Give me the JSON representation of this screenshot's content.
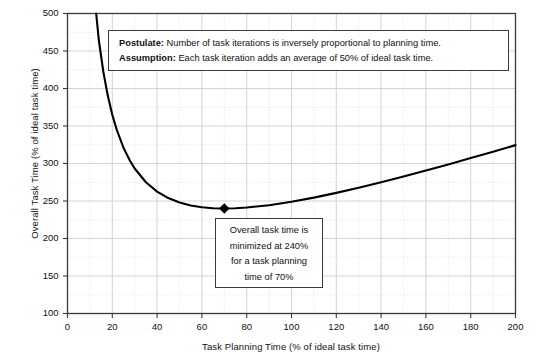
{
  "chart_data": {
    "type": "line",
    "title": "",
    "xlabel": "Task Planning Time (% of ideal task time)",
    "ylabel": "Overall Task Time (% of ideal task time)",
    "xlim": [
      0,
      200
    ],
    "ylim": [
      100,
      500
    ],
    "x_major_ticks": [
      0,
      20,
      40,
      60,
      80,
      100,
      120,
      140,
      160,
      180,
      200
    ],
    "y_major_ticks": [
      100,
      150,
      200,
      250,
      300,
      350,
      400,
      450,
      500
    ],
    "x_minor_step": 10,
    "y_minor_step": 25,
    "grid": true,
    "legend": "none",
    "formula": "y = 100 + x + 4900 / x",
    "series": [
      {
        "name": "Overall Task Time",
        "color": "#000000",
        "x": [
          12.8,
          14,
          16,
          18,
          20,
          22,
          25,
          28,
          30,
          35,
          40,
          45,
          50,
          55,
          60,
          65,
          70,
          75,
          80,
          90,
          100,
          110,
          120,
          130,
          140,
          150,
          160,
          170,
          180,
          190,
          200
        ],
        "y": [
          500.0,
          464.0,
          422.3,
          390.2,
          365.0,
          344.7,
          321.0,
          303.0,
          293.3,
          275.0,
          262.5,
          253.9,
          248.0,
          244.1,
          241.7,
          240.4,
          240.0,
          240.3,
          241.3,
          244.4,
          249.0,
          254.5,
          260.8,
          267.7,
          275.0,
          282.7,
          290.6,
          298.8,
          307.2,
          315.8,
          324.5
        ]
      }
    ],
    "markers": [
      {
        "name": "minimum-point",
        "shape": "diamond",
        "x": 70,
        "y": 240,
        "color": "#000000"
      }
    ],
    "annotations": [
      {
        "name": "postulate-assumption-box",
        "lines": [
          {
            "lead": "Postulate:",
            "text": " Number of task iterations is inversely proportional to planning time."
          },
          {
            "lead": "Assumption:",
            "text": " Each task iteration adds an average of 50% of ideal task time."
          }
        ]
      },
      {
        "name": "minimum-callout-box",
        "lines": [
          "Overall task time is",
          "minimized at 240%",
          "for a task planning",
          "time of 70%"
        ]
      }
    ]
  },
  "axes": {
    "x_tick_labels": [
      "0",
      "20",
      "40",
      "60",
      "80",
      "100",
      "120",
      "140",
      "160",
      "180",
      "200"
    ],
    "y_tick_labels": [
      "100",
      "150",
      "200",
      "250",
      "300",
      "350",
      "400",
      "450",
      "500"
    ],
    "x_title": "Task Planning Time (% of ideal task time)",
    "y_title": "Overall Task Time (% of ideal task time)"
  },
  "postulate": {
    "line1_lead": "Postulate:",
    "line1_text": " Number of task iterations is inversely proportional to planning time.",
    "line2_lead": "Assumption:",
    "line2_text": " Each task iteration adds an average of 50% of ideal task time."
  },
  "min_callout": {
    "line1": "Overall task time is",
    "line2": "minimized at 240%",
    "line3": "for a task planning",
    "line4": "time of 70%"
  },
  "colors": {
    "curve": "#000000",
    "axis": "#3a3a3a",
    "grid_major": "#cfcfcf",
    "grid_minor": "#d8d8d8",
    "background": "#ffffff",
    "text": "#111111"
  }
}
